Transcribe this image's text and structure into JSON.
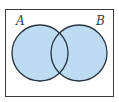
{
  "diagram": {
    "type": "venn",
    "sets": [
      {
        "label": "A"
      },
      {
        "label": "B"
      }
    ],
    "shaded_region": "A ∪ B",
    "colors": {
      "fill": "#bddcf2",
      "stroke": "#2b3441",
      "frame": "#3a3a3a",
      "background": "#ffffff"
    }
  }
}
